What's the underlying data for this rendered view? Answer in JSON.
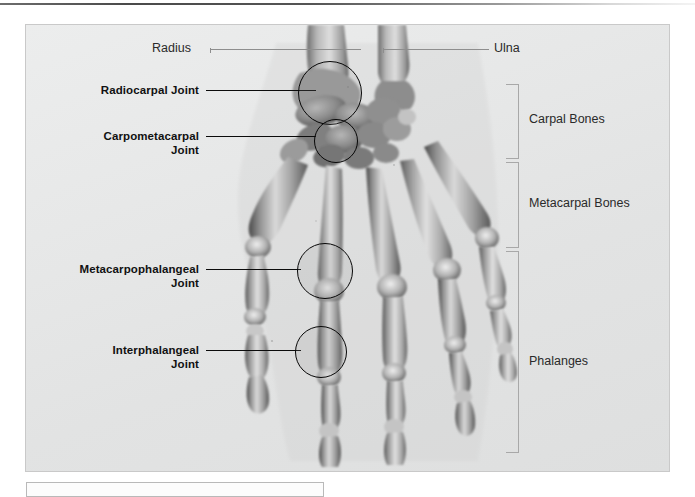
{
  "figure": {
    "alt_title": "X-ray of human hand skeleton with labeled bones and joints",
    "background_color": "#e9e9e9",
    "frame_border_color": "#c9c9c9"
  },
  "callout_labels": [
    {
      "id": "radiocarpal",
      "text": "Radiocarpal Joint",
      "style": "bold"
    },
    {
      "id": "carpometacarpal",
      "text": "Carpometacarpal\nJoint",
      "style": "bold"
    },
    {
      "id": "metacarpophalangeal",
      "text": "Metacarpophalangeal\nJoint",
      "style": "bold"
    },
    {
      "id": "interphalangeal",
      "text": "Interphalangeal\nJoint",
      "style": "bold"
    }
  ],
  "bone_labels": [
    {
      "id": "radius",
      "text": "Radius",
      "style": "plain",
      "side": "left"
    },
    {
      "id": "ulna",
      "text": "Ulna",
      "style": "plain",
      "side": "right"
    }
  ],
  "bone_groups": [
    {
      "id": "carpal",
      "text": "Carpal Bones"
    },
    {
      "id": "metacarpal",
      "text": "Metacarpal Bones"
    },
    {
      "id": "phalanges",
      "text": "Phalanges"
    }
  ],
  "colors": {
    "label_text": "#111111",
    "leader_bold": "#0b0b0b",
    "leader_thin": "#8e8e8e",
    "bracket": "#a8a8a8",
    "callout_ring": "#080808"
  },
  "caption_box": {
    "text": ""
  }
}
